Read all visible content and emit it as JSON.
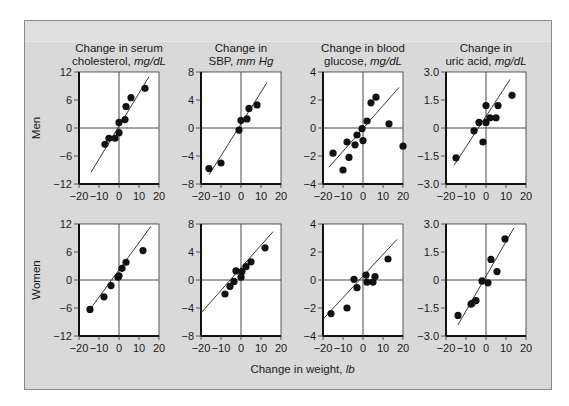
{
  "chart_data": {
    "type": "scatter",
    "layout": "2x4 small multiples",
    "xlabel": "Change in weight,",
    "xlabel_unit": "lb",
    "x_ticks": [
      -20,
      -10,
      0,
      10,
      20
    ],
    "xlim": [
      -20,
      20
    ],
    "rows": [
      "Men",
      "Women"
    ],
    "columns": [
      {
        "title_line1": "Change in serum",
        "title_line2": "cholesterol,",
        "unit": "mg/dL",
        "ylim": [
          -12,
          12
        ],
        "y_ticks": [
          "12",
          "6",
          "0",
          "−6",
          "−12"
        ],
        "y_vals": [
          12,
          6,
          0,
          -6,
          -12
        ]
      },
      {
        "title_line1": "Change in",
        "title_line2": "SBP,",
        "unit": "mm Hg",
        "ylim": [
          -8,
          8
        ],
        "y_ticks": [
          "8",
          "4",
          "0",
          "−4",
          "−8"
        ],
        "y_vals": [
          8,
          4,
          0,
          -4,
          -8
        ]
      },
      {
        "title_line1": "Change in blood",
        "title_line2": "glucose,",
        "unit": "mg/dL",
        "ylim": [
          -4,
          4
        ],
        "y_ticks": [
          "4",
          "2",
          "0",
          "−2",
          "−4"
        ],
        "y_vals": [
          4,
          2,
          0,
          -2,
          -4
        ]
      },
      {
        "title_line1": "Change in",
        "title_line2": "uric acid,",
        "unit": "mg/dL",
        "ylim": [
          -3,
          3
        ],
        "y_ticks": [
          "3.0",
          "1.5",
          "0",
          "−1.5",
          "−3.0"
        ],
        "y_vals": [
          3,
          1.5,
          0,
          -1.5,
          -3
        ]
      }
    ],
    "panels": [
      {
        "row": "Men",
        "col": 0,
        "points": [
          [
            -7,
            -3.5
          ],
          [
            -5,
            -2.2
          ],
          [
            -2,
            -2.2
          ],
          [
            0,
            -1
          ],
          [
            0,
            1.2
          ],
          [
            3,
            1.8
          ],
          [
            3.5,
            4.6
          ],
          [
            6,
            6.5
          ],
          [
            13,
            8.5
          ]
        ],
        "line": [
          [
            -14,
            -9.5
          ],
          [
            15,
            11
          ]
        ]
      },
      {
        "row": "Men",
        "col": 1,
        "points": [
          [
            -16,
            -5.8
          ],
          [
            -10,
            -5
          ],
          [
            -1,
            -0.3
          ],
          [
            0,
            1.1
          ],
          [
            3,
            1.3
          ],
          [
            4,
            2.8
          ],
          [
            8,
            3.3
          ]
        ],
        "line": [
          [
            -16,
            -6.7
          ],
          [
            13,
            6.5
          ]
        ]
      },
      {
        "row": "Men",
        "col": 2,
        "points": [
          [
            -15,
            -1.8
          ],
          [
            -10,
            -3
          ],
          [
            -8,
            -1
          ],
          [
            -7,
            -2.1
          ],
          [
            -4,
            -1.2
          ],
          [
            -3,
            -0.5
          ],
          [
            -0.5,
            -0.05
          ],
          [
            0,
            -0.9
          ],
          [
            2,
            0.5
          ],
          [
            4,
            1.8
          ],
          [
            6.5,
            2.2
          ],
          [
            13,
            0.3
          ],
          [
            20,
            -1.3
          ]
        ],
        "line": [
          [
            -17,
            -2.8
          ],
          [
            18,
            2.9
          ]
        ]
      },
      {
        "row": "Men",
        "col": 3,
        "points": [
          [
            -15,
            -1.6
          ],
          [
            -6,
            -0.15
          ],
          [
            -3.5,
            0.3
          ],
          [
            -1.5,
            -0.75
          ],
          [
            0,
            1.2
          ],
          [
            0,
            0.3
          ],
          [
            2,
            0.55
          ],
          [
            5,
            0.55
          ],
          [
            6,
            1.2
          ],
          [
            13,
            1.75
          ]
        ],
        "line": [
          [
            -16,
            -2.0
          ],
          [
            12,
            2.6
          ]
        ]
      },
      {
        "row": "Women",
        "col": 0,
        "points": [
          [
            -14.5,
            -6.3
          ],
          [
            -7.5,
            -3.6
          ],
          [
            -4,
            -1.2
          ],
          [
            -0.5,
            0.6
          ],
          [
            0,
            0.9
          ],
          [
            1.5,
            2.5
          ],
          [
            3.5,
            3.8
          ],
          [
            12,
            6.3
          ]
        ],
        "line": [
          [
            -14,
            -6
          ],
          [
            16,
            11.5
          ]
        ]
      },
      {
        "row": "Women",
        "col": 1,
        "points": [
          [
            -8,
            -2
          ],
          [
            -5.5,
            -0.9
          ],
          [
            -3.5,
            -0.2
          ],
          [
            -2.5,
            1.3
          ],
          [
            0,
            0.4
          ],
          [
            0.5,
            1.2
          ],
          [
            2.5,
            1.9
          ],
          [
            5,
            2.6
          ],
          [
            12,
            4.6
          ]
        ],
        "line": [
          [
            -20,
            -4.7
          ],
          [
            16,
            6.9
          ]
        ]
      },
      {
        "row": "Women",
        "col": 2,
        "points": [
          [
            -16,
            -2.4
          ],
          [
            -8,
            -2
          ],
          [
            -4.5,
            0.05
          ],
          [
            -3,
            -0.55
          ],
          [
            1.5,
            0.35
          ],
          [
            2,
            -0.15
          ],
          [
            5,
            -0.15
          ],
          [
            6,
            0.25
          ],
          [
            12.5,
            1.5
          ]
        ],
        "line": [
          [
            -20,
            -2.8
          ],
          [
            17,
            2.9
          ]
        ]
      },
      {
        "row": "Women",
        "col": 3,
        "points": [
          [
            -14,
            -1.9
          ],
          [
            -7.5,
            -1.3
          ],
          [
            -7,
            -1.25
          ],
          [
            -5,
            -1.1
          ],
          [
            -2,
            -0.05
          ],
          [
            1,
            -0.15
          ],
          [
            2.5,
            1.1
          ],
          [
            5.5,
            0.45
          ],
          [
            9.5,
            2.2
          ]
        ],
        "line": [
          [
            -14,
            -2.4
          ],
          [
            14,
            2.8
          ]
        ]
      }
    ]
  }
}
